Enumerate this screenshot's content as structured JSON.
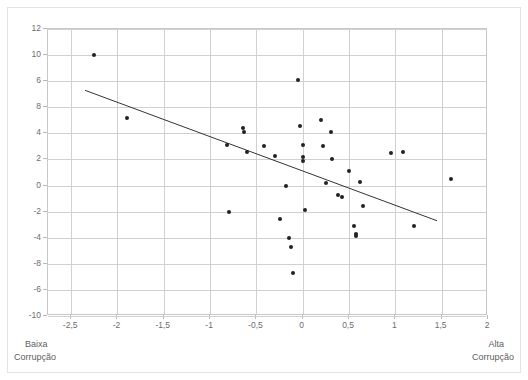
{
  "chart_data": {
    "type": "scatter",
    "title": "",
    "subtitle": "",
    "xlabel": "",
    "ylabel": "",
    "xlim": [
      -2.75,
      2.0
    ],
    "ylim": [
      -10,
      12
    ],
    "grid": true,
    "legend": null,
    "legend_position": "none",
    "decimal_separator": ",",
    "xticks": [
      -2.5,
      -2,
      -1.5,
      -1,
      -0.5,
      0,
      0.5,
      1,
      1.5,
      2
    ],
    "xtick_labels": [
      "-2,5",
      "-2",
      "-1,5",
      "-1",
      "-0,5",
      "0",
      "0,5",
      "1",
      "1,5",
      "2"
    ],
    "yticks": [
      12,
      10,
      8,
      6,
      4,
      2,
      0,
      -2,
      -4,
      -6,
      -8,
      -10
    ],
    "ytick_labels": [
      "12",
      "10",
      "6",
      "8",
      "4",
      "2",
      "0",
      "-2",
      "-4",
      "-8",
      "-6",
      "-10"
    ],
    "annotations": {
      "bottom_left_line1": "Baixa",
      "bottom_left_line2": "Corrupção",
      "bottom_right_line1": "Alta",
      "bottom_right_line2": "Corrupção"
    },
    "marker": {
      "shape": "circle",
      "color": "#222222",
      "size_px": 4
    },
    "trendline": {
      "type": "linear",
      "color": "#333333",
      "width_px": 1,
      "x_start": -2.35,
      "y_start": 7.3,
      "x_end": 1.45,
      "y_end": -2.7
    },
    "points": [
      {
        "x": -2.25,
        "y": 10.0
      },
      {
        "x": -1.9,
        "y": 5.2
      },
      {
        "x": -0.82,
        "y": 3.1
      },
      {
        "x": -0.8,
        "y": -2.0
      },
      {
        "x": -0.65,
        "y": 4.4
      },
      {
        "x": -0.63,
        "y": 4.1
      },
      {
        "x": -0.6,
        "y": 2.6
      },
      {
        "x": -0.42,
        "y": 3.0
      },
      {
        "x": -0.3,
        "y": 2.3
      },
      {
        "x": -0.25,
        "y": -2.6
      },
      {
        "x": -0.18,
        "y": 0.0
      },
      {
        "x": -0.15,
        "y": -4.0
      },
      {
        "x": -0.13,
        "y": -4.7
      },
      {
        "x": -0.1,
        "y": -6.7
      },
      {
        "x": -0.05,
        "y": 8.1
      },
      {
        "x": -0.03,
        "y": 4.6
      },
      {
        "x": 0.0,
        "y": 3.1
      },
      {
        "x": 0.0,
        "y": 2.2
      },
      {
        "x": 0.0,
        "y": 1.9
      },
      {
        "x": 0.02,
        "y": -1.9
      },
      {
        "x": 0.2,
        "y": 5.0
      },
      {
        "x": 0.22,
        "y": 3.0
      },
      {
        "x": 0.25,
        "y": 0.2
      },
      {
        "x": 0.3,
        "y": 4.1
      },
      {
        "x": 0.32,
        "y": 2.0
      },
      {
        "x": 0.38,
        "y": -0.7
      },
      {
        "x": 0.42,
        "y": -0.9
      },
      {
        "x": 0.5,
        "y": 1.1
      },
      {
        "x": 0.55,
        "y": -3.1
      },
      {
        "x": 0.57,
        "y": -3.7
      },
      {
        "x": 0.58,
        "y": -3.9
      },
      {
        "x": 0.62,
        "y": 0.3
      },
      {
        "x": 0.65,
        "y": -1.6
      },
      {
        "x": 0.95,
        "y": 2.5
      },
      {
        "x": 1.08,
        "y": 2.6
      },
      {
        "x": 1.2,
        "y": -3.1
      },
      {
        "x": 1.6,
        "y": 0.5
      }
    ]
  }
}
